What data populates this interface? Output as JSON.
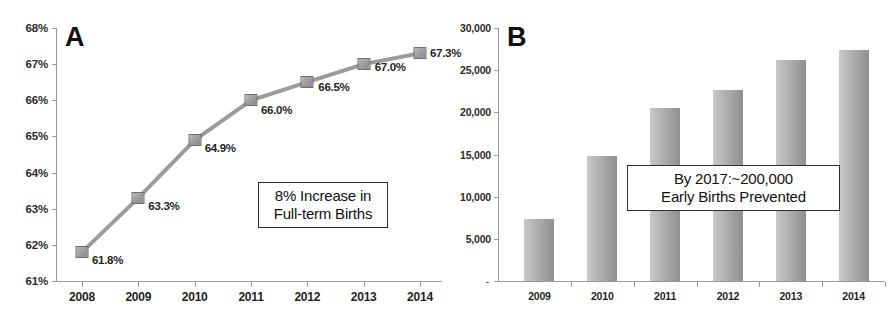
{
  "figure": {
    "panels": [
      "A",
      "B"
    ],
    "background": "#ffffff",
    "series_color": "#9a9a9a",
    "text_color": "#1f1f1f"
  },
  "panel_a": {
    "letter": "A",
    "callout": {
      "line1": "8% Increase in",
      "line2": "Full-term Births"
    },
    "chart_data": {
      "type": "line",
      "title": "A",
      "xlabel": "",
      "ylabel": "",
      "categories": [
        "2008",
        "2009",
        "2010",
        "2011",
        "2012",
        "2013",
        "2014"
      ],
      "values": [
        61.8,
        63.3,
        64.9,
        66.0,
        66.5,
        67.0,
        67.3
      ],
      "point_labels": [
        "61.8%",
        "63.3%",
        "64.9%",
        "66.0%",
        "66.5%",
        "67.0%",
        "67.3%"
      ],
      "ytick_labels": [
        "68%",
        "67%",
        "66%",
        "65%",
        "64%",
        "63%",
        "62%",
        "61%"
      ],
      "yticks": [
        68,
        67,
        66,
        65,
        64,
        63,
        62,
        61
      ],
      "ylim": [
        61,
        68
      ],
      "grid": false,
      "legend": "none",
      "marker": "square",
      "annotation": "8% Increase in Full-term Births"
    }
  },
  "panel_b": {
    "letter": "B",
    "callout": {
      "line1": "By 2017:~200,000",
      "line2": "Early Births Prevented"
    },
    "zero_tick": "-",
    "chart_data": {
      "type": "bar",
      "title": "B",
      "xlabel": "",
      "ylabel": "",
      "categories": [
        "2009",
        "2010",
        "2011",
        "2012",
        "2013",
        "2014"
      ],
      "values": [
        7400,
        14800,
        20500,
        22600,
        26200,
        27400
      ],
      "ytick_labels": [
        "30,000",
        "25,000",
        "20,000",
        "15,000",
        "10,000",
        "5,000",
        "-"
      ],
      "yticks": [
        30000,
        25000,
        20000,
        15000,
        10000,
        5000,
        0
      ],
      "ylim": [
        0,
        30000
      ],
      "grid": false,
      "legend": "none",
      "annotation": "By 2017:~200,000 Early Births Prevented"
    }
  }
}
